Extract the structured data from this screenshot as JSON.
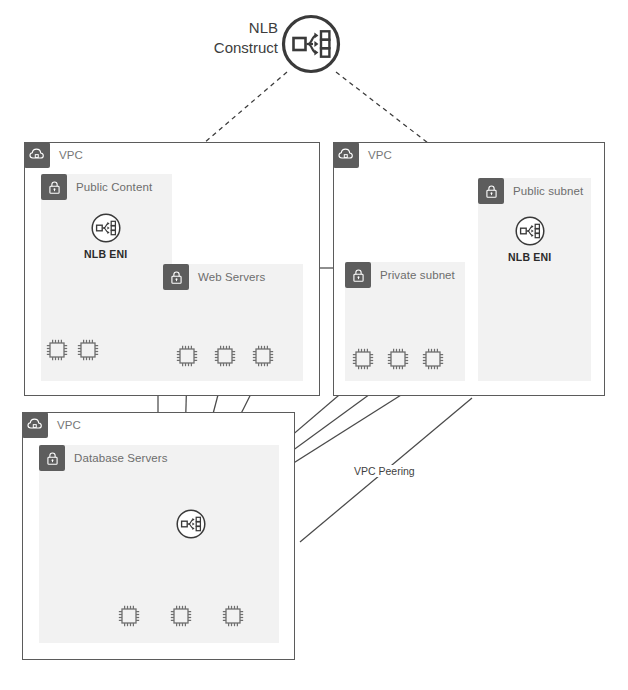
{
  "diagram": {
    "title_line1": "NLB",
    "title_line2": "Construct",
    "title_icon": "network-load-balancer-icon"
  },
  "groups": [
    {
      "id": "vpc-left",
      "label": "VPC",
      "icon": "vpc-cloud-icon",
      "subnets": [
        {
          "id": "public-content",
          "label": "Public Content",
          "icon": "lock-icon",
          "nodes": [
            {
              "id": "nlb-eni-left",
              "label": "NLB ENI",
              "icon": "nlb-eni-icon"
            },
            {
              "id": "pc-ec2-1",
              "label": "",
              "icon": "ec2-instance-icon"
            },
            {
              "id": "pc-ec2-2",
              "label": "",
              "icon": "ec2-instance-icon"
            }
          ]
        },
        {
          "id": "web-servers",
          "label": "Web Servers",
          "icon": "lock-icon",
          "nodes": [
            {
              "id": "web-ec2-1",
              "label": "",
              "icon": "ec2-instance-icon"
            },
            {
              "id": "web-ec2-2",
              "label": "",
              "icon": "ec2-instance-icon"
            },
            {
              "id": "web-ec2-3",
              "label": "",
              "icon": "ec2-instance-icon"
            }
          ]
        }
      ]
    },
    {
      "id": "vpc-right",
      "label": "VPC",
      "icon": "vpc-cloud-icon",
      "subnets": [
        {
          "id": "public-subnet",
          "label": "Public subnet",
          "icon": "lock-icon",
          "nodes": [
            {
              "id": "nlb-eni-right",
              "label": "NLB ENI",
              "icon": "nlb-eni-icon"
            }
          ]
        },
        {
          "id": "private-subnet",
          "label": "Private subnet",
          "icon": "lock-icon",
          "nodes": [
            {
              "id": "priv-ec2-1",
              "label": "",
              "icon": "ec2-instance-icon"
            },
            {
              "id": "priv-ec2-2",
              "label": "",
              "icon": "ec2-instance-icon"
            },
            {
              "id": "priv-ec2-3",
              "label": "",
              "icon": "ec2-instance-icon"
            }
          ]
        }
      ]
    },
    {
      "id": "vpc-bottom",
      "label": "VPC",
      "icon": "vpc-cloud-icon",
      "subnets": [
        {
          "id": "database-servers",
          "label": "Database Servers",
          "icon": "lock-icon",
          "nodes": [
            {
              "id": "nlb-eni-db",
              "label": "",
              "icon": "nlb-eni-icon"
            },
            {
              "id": "db-ec2-1",
              "label": "",
              "icon": "ec2-instance-icon"
            },
            {
              "id": "db-ec2-2",
              "label": "",
              "icon": "ec2-instance-icon"
            },
            {
              "id": "db-ec2-3",
              "label": "",
              "icon": "ec2-instance-icon"
            }
          ]
        }
      ]
    }
  ],
  "edges": {
    "peering_label": "VPC Peering"
  },
  "colors": {
    "chip_fill": "#5d5d5d",
    "subnet_fill": "#f2f2f2",
    "border": "#5b5b5b",
    "label_gray": "#777777",
    "stroke": "#4a4a4a"
  }
}
